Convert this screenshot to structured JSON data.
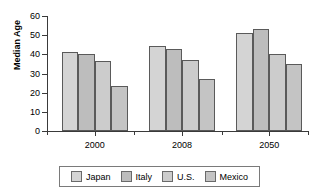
{
  "chart_data": {
    "type": "bar",
    "title": "",
    "xlabel": "",
    "ylabel": "Median Age",
    "ylim": [
      0,
      60
    ],
    "yticks": [
      0,
      10,
      20,
      30,
      40,
      50,
      60
    ],
    "categories": [
      "2000",
      "2008",
      "2050"
    ],
    "grid": false,
    "legend_position": "bottom",
    "series": [
      {
        "name": "Japan",
        "color": "#d4d4d4",
        "values": [
          41,
          44.5,
          51
        ]
      },
      {
        "name": "Italy",
        "color": "#bdbdbd",
        "values": [
          40,
          43,
          53
        ]
      },
      {
        "name": "U.S.",
        "color": "#cccccc",
        "values": [
          36.5,
          37,
          40
        ]
      },
      {
        "name": "Mexico",
        "color": "#c4c4c4",
        "values": [
          23.5,
          27,
          35
        ]
      }
    ]
  },
  "legend": {
    "items": [
      {
        "label": "Japan"
      },
      {
        "label": "Italy"
      },
      {
        "label": "U.S."
      },
      {
        "label": "Mexico"
      }
    ]
  }
}
